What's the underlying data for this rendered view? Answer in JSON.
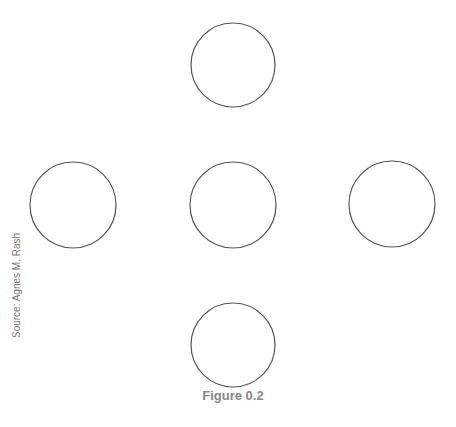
{
  "figure": {
    "caption": "Figure 0.2",
    "source": "Source: Agnes M. Rash"
  },
  "circles": [
    {
      "name": "circle-top",
      "cx": 233,
      "cy": 65,
      "r": 42
    },
    {
      "name": "circle-left",
      "cx": 73,
      "cy": 205,
      "r": 43
    },
    {
      "name": "circle-center",
      "cx": 233,
      "cy": 205,
      "r": 43
    },
    {
      "name": "circle-right",
      "cx": 392,
      "cy": 204,
      "r": 43
    },
    {
      "name": "circle-bottom",
      "cx": 233,
      "cy": 345,
      "r": 42
    }
  ],
  "colors": {
    "stroke": "#555555",
    "caption": "#888888"
  }
}
